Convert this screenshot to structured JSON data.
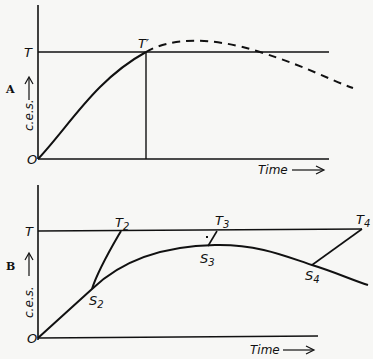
{
  "panels": [
    {
      "id": "A",
      "panel_label": "A",
      "y_axis_label": "c.e.s.",
      "x_axis_label": "Time",
      "origin_label": "O",
      "threshold_label": "T",
      "points": [
        {
          "label": "T",
          "sub": "′"
        }
      ],
      "curve": "solid rise from O to T′, dashed continuation peaking above T then falling below T"
    },
    {
      "id": "B",
      "panel_label": "B",
      "y_axis_label": "c.e.s.",
      "x_axis_label": "Time",
      "origin_label": "O",
      "threshold_label": "T",
      "t_points": [
        {
          "label": "T",
          "sub": "2"
        },
        {
          "label": "T",
          "sub": "3"
        },
        {
          "label": "T",
          "sub": "4"
        }
      ],
      "s_points": [
        {
          "label": "S",
          "sub": "2"
        },
        {
          "label": "S",
          "sub": "3"
        },
        {
          "label": "S",
          "sub": "4"
        }
      ],
      "curve": "solid rise from O peaking below T then falling; lines connect S points to T points"
    }
  ]
}
